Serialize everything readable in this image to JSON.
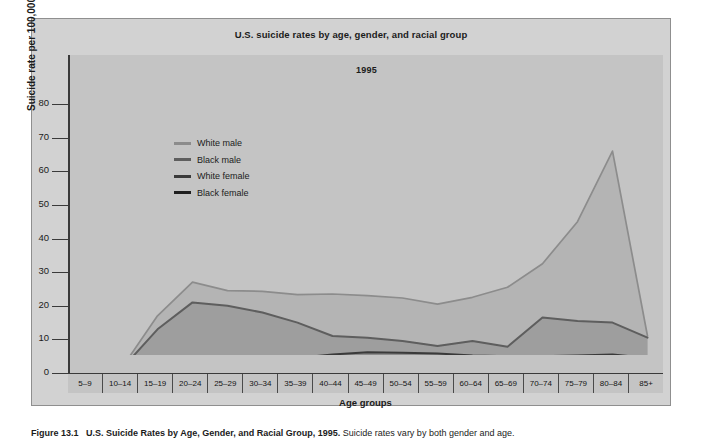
{
  "figure": {
    "title": "U.S. suicide rates by age, gender, and racial group",
    "year_label": "1995",
    "caption_lead": "Figure 13.1",
    "caption_title": "U.S. Suicide Rates by Age, Gender, and Racial Group, 1995.",
    "caption_rest": " Suicide rates vary by both gender and age."
  },
  "colors": {
    "page_background": "#ffffff",
    "panel_background": "#d2d2d2",
    "plot_background": "#c4c4c4",
    "axis": "#3a3a3a",
    "white_male": "#8c8c8c",
    "black_male": "#5e5e5e",
    "white_female": "#3a3a3a",
    "black_female": "#1f1f1f",
    "band_white_male": "#b4b4b4",
    "band_black_male": "#9e9e9e",
    "band_white_female": "#8c8c8c",
    "band_black_female": "#7a7a7a"
  },
  "legend": {
    "position": "top-left-inside",
    "items": [
      {
        "label": "White male",
        "color": "#8c8c8c"
      },
      {
        "label": "Black male",
        "color": "#5e5e5e"
      },
      {
        "label": "White female",
        "color": "#3a3a3a"
      },
      {
        "label": "Black female",
        "color": "#1f1f1f"
      }
    ]
  },
  "y_axis": {
    "title": "Suicide rate per 100,000",
    "ticks": [
      "0",
      "10",
      "20",
      "30",
      "40",
      "50",
      "60",
      "70",
      "80"
    ]
  },
  "x_axis": {
    "title": "Age groups"
  },
  "chart_data": {
    "type": "line",
    "title": "U.S. suicide rates by age, gender, and racial group",
    "subtitle": "1995",
    "xlabel": "Age groups",
    "ylabel": "Suicide rate per 100,000",
    "ylim": [
      0,
      80
    ],
    "ytick_step": 10,
    "grid": false,
    "legend_position": "upper left",
    "categories": [
      "5–9",
      "10–14",
      "15–19",
      "20–24",
      "25–29",
      "30–34",
      "35–39",
      "40–44",
      "45–49",
      "50–54",
      "55–59",
      "60–64",
      "65–69",
      "70–74",
      "75–79",
      "80–84",
      "85+"
    ],
    "series": [
      {
        "name": "White male",
        "color": "#8c8c8c",
        "values": [
          0.0,
          1.8,
          17.0,
          27.0,
          24.5,
          24.3,
          23.3,
          23.5,
          23.0,
          22.3,
          20.5,
          22.5,
          25.5,
          32.5,
          45.0,
          66.0,
          11.0
        ]
      },
      {
        "name": "Black male",
        "color": "#5e5e5e",
        "values": [
          0.0,
          1.5,
          13.0,
          21.0,
          20.0,
          18.0,
          15.0,
          11.0,
          10.5,
          9.5,
          8.0,
          9.5,
          7.8,
          16.5,
          15.5,
          15.0,
          10.5
        ]
      },
      {
        "name": "White female",
        "color": "#3a3a3a",
        "values": [
          0.0,
          0.5,
          1.5,
          2.2,
          3.0,
          3.8,
          4.5,
          5.5,
          6.2,
          6.0,
          5.8,
          5.2,
          5.0,
          5.0,
          5.2,
          5.5,
          4.5
        ]
      },
      {
        "name": "Black female",
        "color": "#1f1f1f",
        "values": [
          0.0,
          0.2,
          0.8,
          1.0,
          1.3,
          1.5,
          1.8,
          2.2,
          2.0,
          1.6,
          1.4,
          1.6,
          2.0,
          1.5,
          1.0,
          0.4,
          0.6
        ]
      }
    ]
  }
}
